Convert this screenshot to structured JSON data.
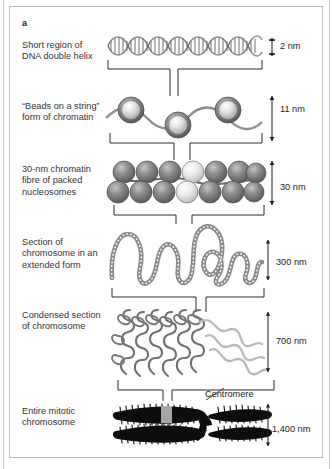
{
  "figure": {
    "panel_letter": "a",
    "background_color": "#ffffff",
    "frame_color": "#bdbdbd"
  },
  "stages": [
    {
      "id": "dna-double-helix",
      "label": "Short region of\nDNA double helix",
      "size": "2 nm",
      "art": "double-helix"
    },
    {
      "id": "beads-on-a-string",
      "label": "“Beads on a string”\nform of chromatin",
      "size": "11 nm",
      "art": "nucleosome-beads"
    },
    {
      "id": "thirty-nm-fibre",
      "label": "30-nm chromatin\nfibre of packed\nnucleosomes",
      "size": "30 nm",
      "art": "packed-nucleosome-fibre"
    },
    {
      "id": "extended-chromosome-section",
      "label": "Section of\nchromosome in an\nextended form",
      "size": "300 nm",
      "art": "looped-beaded-fibre"
    },
    {
      "id": "condensed-chromosome-section",
      "label": "Condensed section\nof chromosome",
      "size": "700 nm",
      "art": "condensed-coiled-loops"
    },
    {
      "id": "entire-mitotic-chromosome",
      "label": "Entire mitotic\nchromosome",
      "size": "1,400 nm",
      "art": "mitotic-chromosome"
    }
  ],
  "annotations": {
    "centromere": "Centromere"
  },
  "colors": {
    "line": "#3a3a3a",
    "bead_dark": "#6e6e6e",
    "bead_light": "#d8d8d8",
    "fibre_gray": "#8c8c8c",
    "chromosome_black": "#0d0d0d",
    "highlight_gray": "#b3b3b3"
  }
}
